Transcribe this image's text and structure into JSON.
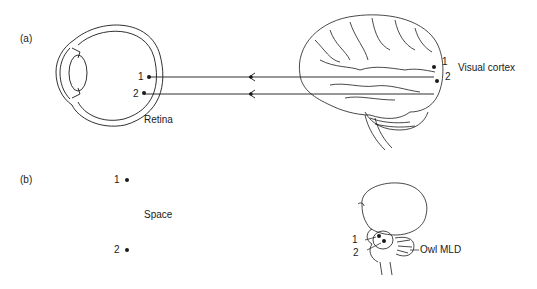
{
  "panels": {
    "a": {
      "label": "(a)",
      "retina_label": "Retina",
      "cortex_label": "Visual cortex",
      "retina_points": [
        "1",
        "2"
      ],
      "cortex_points": [
        "1",
        "2"
      ]
    },
    "b": {
      "label": "(b)",
      "space_label": "Space",
      "space_points": [
        "1",
        "2"
      ],
      "brain_points": [
        "1",
        "2"
      ],
      "mld_label": "Owl MLD"
    }
  },
  "colors": {
    "ink": "#1a1a1a",
    "background": "#ffffff"
  }
}
